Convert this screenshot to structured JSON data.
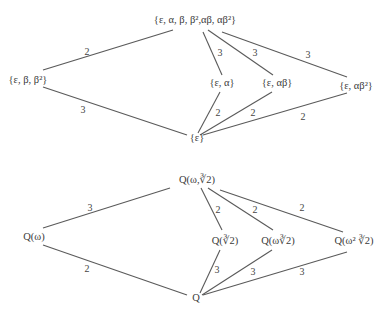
{
  "top_lattice": {
    "nodes": {
      "top": "{ε, α, β, β²,αβ, αβ²}",
      "left": "{ε,  β, β²}",
      "mid1": "{ε, α}",
      "mid2": "{ε, αβ}",
      "mid3": "{ε, αβ²}",
      "bottom": "{ε}"
    },
    "edges": [
      {
        "from": "top",
        "to": "left",
        "label": "2"
      },
      {
        "from": "left",
        "to": "bottom",
        "label": "3"
      },
      {
        "from": "top",
        "to": "mid1",
        "label": "3"
      },
      {
        "from": "top",
        "to": "mid2",
        "label": "3"
      },
      {
        "from": "top",
        "to": "mid3",
        "label": "3"
      },
      {
        "from": "mid1",
        "to": "bottom",
        "label": "2"
      },
      {
        "from": "mid2",
        "to": "bottom",
        "label": "2"
      },
      {
        "from": "mid3",
        "to": "bottom",
        "label": "2"
      }
    ]
  },
  "bottom_lattice": {
    "nodes": {
      "top": "Q(ω,∛2)",
      "left": "Q(ω)",
      "mid1": "Q(∛2)",
      "mid2": "Q(ω∛2)",
      "mid3": "Q(ω² ∛2)",
      "bottom": "Q"
    },
    "edges": [
      {
        "from": "top",
        "to": "left",
        "label": "3"
      },
      {
        "from": "left",
        "to": "bottom",
        "label": "2"
      },
      {
        "from": "top",
        "to": "mid1",
        "label": "2"
      },
      {
        "from": "top",
        "to": "mid2",
        "label": "2"
      },
      {
        "from": "top",
        "to": "mid3",
        "label": "2"
      },
      {
        "from": "mid1",
        "to": "bottom",
        "label": "3"
      },
      {
        "from": "mid2",
        "to": "bottom",
        "label": "3"
      },
      {
        "from": "mid3",
        "to": "bottom",
        "label": "3"
      }
    ]
  }
}
